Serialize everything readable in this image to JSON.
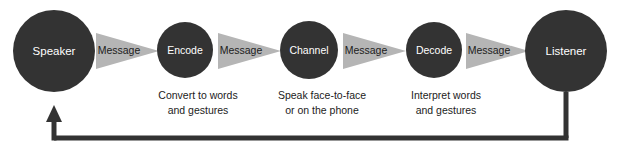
{
  "diagram": {
    "type": "process-flow",
    "colors": {
      "background": "#ffffff",
      "node_fill": "#333333",
      "node_text": "#ffffff",
      "arrow_fill": "#b5b5b5",
      "arrow_text": "#1c1c1c",
      "caption_text": "#1c1c1c",
      "feedback_line": "#333333"
    },
    "nodes": [
      {
        "id": "speaker",
        "label": "Speaker",
        "shape": "circle",
        "size": "large",
        "cx": 54,
        "cy": 51,
        "r": 41,
        "caption": []
      },
      {
        "id": "encode",
        "label": "Encode",
        "shape": "circle",
        "size": "small",
        "cx": 185,
        "cy": 50,
        "r": 28,
        "caption": [
          "Convert to words",
          "and gestures"
        ]
      },
      {
        "id": "channel",
        "label": "Channel",
        "shape": "circle",
        "size": "small",
        "cx": 309,
        "cy": 50,
        "r": 29,
        "caption": [
          "Speak face-to-face",
          "or on the phone"
        ]
      },
      {
        "id": "decode",
        "label": "Decode",
        "shape": "circle",
        "size": "small",
        "cx": 434,
        "cy": 50,
        "r": 28,
        "caption": [
          "Interpret words",
          "and gestures"
        ]
      },
      {
        "id": "listener",
        "label": "Listener",
        "shape": "circle",
        "size": "large",
        "cx": 566,
        "cy": 51,
        "r": 41,
        "caption": []
      }
    ],
    "arrows": [
      {
        "id": "arrow-1",
        "label": "Message",
        "from": "speaker",
        "to": "encode",
        "x1": 96,
        "x2": 159,
        "cy": 51,
        "half_height": 18
      },
      {
        "id": "arrow-2",
        "label": "Message",
        "from": "encode",
        "to": "channel",
        "x1": 218,
        "x2": 281,
        "cy": 51,
        "half_height": 18
      },
      {
        "id": "arrow-3",
        "label": "Message",
        "from": "channel",
        "to": "decode",
        "x1": 343,
        "x2": 406,
        "cy": 51,
        "half_height": 18
      },
      {
        "id": "arrow-4",
        "label": "Message",
        "from": "decode",
        "to": "listener",
        "x1": 466,
        "x2": 529,
        "cy": 51,
        "half_height": 18
      }
    ],
    "feedback": {
      "id": "feedback-loop",
      "label": "",
      "from": "listener",
      "to": "speaker",
      "start_x": 566,
      "start_y": 93,
      "line_y": 138,
      "end_x": 54,
      "arrow_tip_y": 107,
      "stroke_width": 5
    }
  }
}
